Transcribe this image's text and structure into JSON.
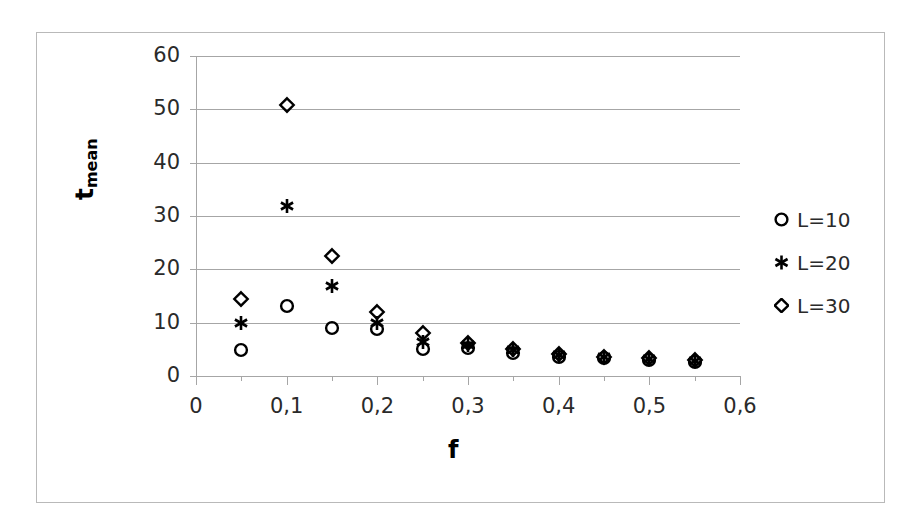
{
  "chart_data": {
    "type": "scatter",
    "title": "",
    "xlabel": "f",
    "ylabel": "t_mean",
    "ylabel_base": "t",
    "ylabel_sub": "mean",
    "xlim": [
      0,
      0.6
    ],
    "ylim": [
      0,
      60
    ],
    "grid": true,
    "grid_axis": "y",
    "legend_position": "right",
    "x_tick_labels": [
      "0",
      "0,1",
      "0,2",
      "0,3",
      "0,4",
      "0,5",
      "0,6"
    ],
    "x_tick_values": [
      0,
      0.1,
      0.2,
      0.3,
      0.4,
      0.5,
      0.6
    ],
    "x_minor_tick_values": [
      0.05,
      0.15,
      0.25,
      0.35,
      0.45,
      0.55
    ],
    "y_tick_labels": [
      "0",
      "10",
      "20",
      "30",
      "40",
      "50",
      "60"
    ],
    "y_tick_values": [
      0,
      10,
      20,
      30,
      40,
      50,
      60
    ],
    "x": [
      0.05,
      0.1,
      0.15,
      0.2,
      0.25,
      0.3,
      0.35,
      0.4,
      0.45,
      0.5,
      0.55
    ],
    "series": [
      {
        "name": "L=10",
        "marker": "open-circle",
        "color": "#000000",
        "values": [
          4.9,
          13.2,
          9.0,
          8.9,
          5.0,
          5.2,
          4.4,
          3.6,
          3.3,
          3.0,
          2.7
        ]
      },
      {
        "name": "L=20",
        "marker": "asterisk",
        "color": "#000000",
        "values": [
          10.0,
          31.9,
          16.9,
          10.0,
          6.4,
          5.8,
          4.9,
          3.9,
          3.5,
          3.2,
          2.9
        ]
      },
      {
        "name": "L=30",
        "marker": "open-diamond",
        "color": "#000000",
        "values": [
          14.5,
          50.8,
          22.5,
          12.0,
          8.0,
          6.2,
          5.1,
          4.1,
          3.6,
          3.3,
          3.0
        ]
      }
    ]
  },
  "legend": {
    "items": [
      {
        "label": "L=10",
        "marker": "open-circle"
      },
      {
        "label": "L=20",
        "marker": "asterisk"
      },
      {
        "label": "L=30",
        "marker": "open-diamond"
      }
    ]
  }
}
